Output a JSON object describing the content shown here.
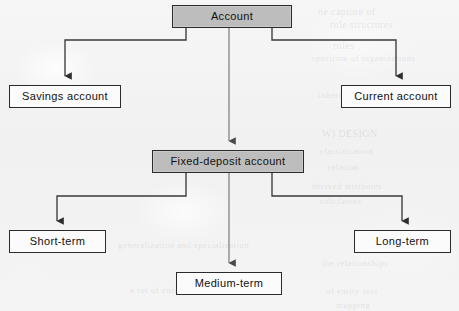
{
  "diagram": {
    "type": "tree",
    "style": {
      "background_color": "#f3f3f3",
      "shaded_node_fill": "#bdbdbd",
      "plain_node_fill": "#fbfbfb",
      "border_color": "#2b2b2b",
      "connector_color": "#3a3a3a",
      "text_color": "#111111"
    },
    "nodes": [
      {
        "id": "account",
        "label": "Account",
        "fill": "shaded",
        "level": 0,
        "x": 172,
        "y": 5,
        "w": 120,
        "h": 23
      },
      {
        "id": "savings-account",
        "label": "Savings account",
        "fill": "plain",
        "level": 1,
        "x": 9,
        "y": 85,
        "w": 112,
        "h": 23
      },
      {
        "id": "current-account",
        "label": "Current account",
        "fill": "plain",
        "level": 1,
        "x": 341,
        "y": 85,
        "w": 110,
        "h": 23
      },
      {
        "id": "fixed-deposit-account",
        "label": "Fixed-deposit account",
        "fill": "shaded",
        "level": 1,
        "x": 152,
        "y": 150,
        "w": 152,
        "h": 23
      },
      {
        "id": "short-term",
        "label": "Short-term",
        "fill": "plain",
        "level": 2,
        "x": 9,
        "y": 230,
        "w": 97,
        "h": 23
      },
      {
        "id": "long-term",
        "label": "Long-term",
        "fill": "plain",
        "level": 2,
        "x": 354,
        "y": 230,
        "w": 97,
        "h": 23
      },
      {
        "id": "medium-term",
        "label": "Medium-term",
        "fill": "plain",
        "level": 2,
        "x": 176,
        "y": 272,
        "w": 106,
        "h": 23
      }
    ],
    "edges": [
      {
        "id": "account-to-savings",
        "from": "account",
        "to": "savings-account",
        "style": "elbow-left",
        "arrow": true
      },
      {
        "id": "account-to-fixed",
        "from": "account",
        "to": "fixed-deposit-account",
        "style": "straight",
        "arrow": true
      },
      {
        "id": "account-to-current",
        "from": "account",
        "to": "current-account",
        "style": "elbow-right",
        "arrow": true
      },
      {
        "id": "fixed-to-short",
        "from": "fixed-deposit-account",
        "to": "short-term",
        "style": "elbow-left",
        "arrow": true
      },
      {
        "id": "fixed-to-medium",
        "from": "fixed-deposit-account",
        "to": "medium-term",
        "style": "straight",
        "arrow": true
      },
      {
        "id": "fixed-to-long",
        "from": "fixed-deposit-account",
        "to": "long-term",
        "style": "elbow-right",
        "arrow": true
      }
    ]
  },
  "bleed_text": [
    {
      "text": "ne capture of",
      "x": 318,
      "y": 6,
      "size": 10
    },
    {
      "text": "rule structures",
      "x": 330,
      "y": 19,
      "size": 10
    },
    {
      "text": "rules",
      "x": 333,
      "y": 40,
      "size": 10
    },
    {
      "text": "spectrum of organizations",
      "x": 312,
      "y": 53,
      "size": 9
    },
    {
      "text": "inheritance structure",
      "x": 318,
      "y": 90,
      "size": 9
    },
    {
      "text": "W) DESIGN",
      "x": 322,
      "y": 128,
      "size": 10
    },
    {
      "text": "classification",
      "x": 320,
      "y": 146,
      "size": 9
    },
    {
      "text": "relation",
      "x": 328,
      "y": 162,
      "size": 9
    },
    {
      "text": "derived attributes",
      "x": 312,
      "y": 181,
      "size": 9
    },
    {
      "text": "subclasses",
      "x": 320,
      "y": 196,
      "size": 9
    },
    {
      "text": "generalization and specialization",
      "x": 118,
      "y": 240,
      "size": 9
    },
    {
      "text": "the relationships",
      "x": 322,
      "y": 258,
      "size": 9
    },
    {
      "text": "a set of entities",
      "x": 130,
      "y": 285,
      "size": 9
    },
    {
      "text": "of entity sets",
      "x": 326,
      "y": 286,
      "size": 9
    },
    {
      "text": "mapping",
      "x": 336,
      "y": 300,
      "size": 9
    }
  ]
}
